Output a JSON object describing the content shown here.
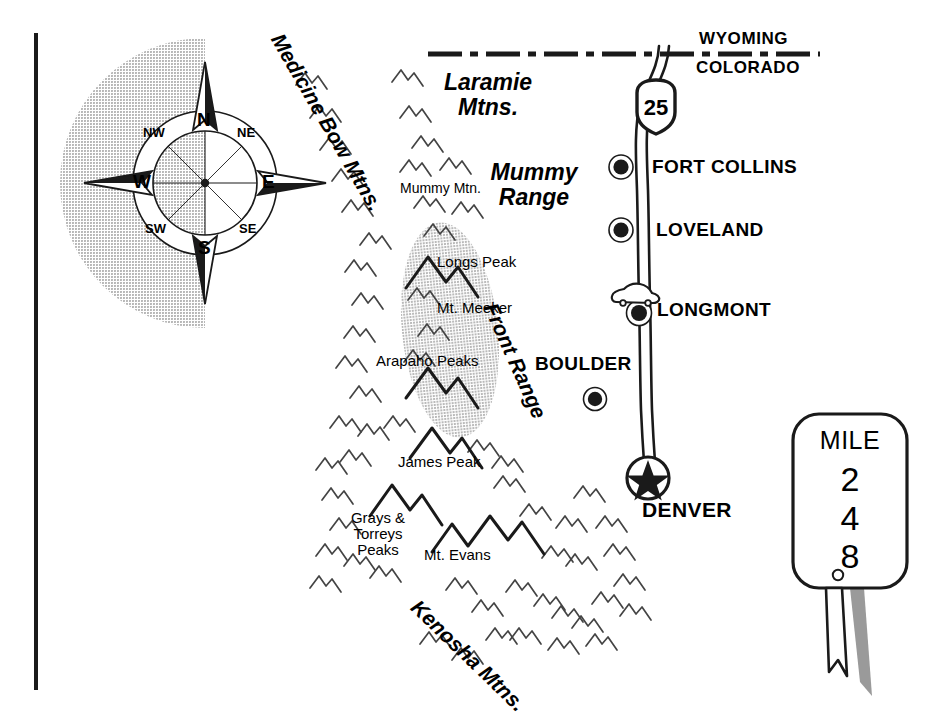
{
  "map": {
    "title": "Colorado Front Range Mountains and Interstate 25 locator map",
    "colors": {
      "ink": "#1a1a1a",
      "tint_gray": "#c6c6c6",
      "shadow_gray": "#9a9a9a",
      "paper": "#ffffff"
    }
  },
  "border": {
    "name": "left-rule"
  },
  "compass": {
    "north": "N",
    "south": "S",
    "east": "E",
    "west": "W",
    "northwest": "NW",
    "northeast": "NE",
    "southwest": "SW",
    "southeast": "SE"
  },
  "states": {
    "upper": "WYOMING",
    "lower": "COLORADO"
  },
  "highway": {
    "shield_number": "25",
    "shield_type": "interstate"
  },
  "cities": [
    {
      "name": "FORT COLLINS",
      "marker": "dot-circle"
    },
    {
      "name": "LOVELAND",
      "marker": "dot-circle"
    },
    {
      "name": "LONGMONT",
      "marker": "dot-circle-with-vehicle"
    },
    {
      "name": "BOULDER",
      "marker": "dot-circle"
    },
    {
      "name": "DENVER",
      "marker": "star-circle-capital"
    }
  ],
  "ranges": [
    {
      "label": "Medicine Bow Mtns.",
      "style": "rotated-italic"
    },
    {
      "label": "Laramie\nMtns.",
      "style": "italic"
    },
    {
      "label": "Mummy\nRange",
      "style": "italic"
    },
    {
      "label": "Front Range",
      "style": "rotated-italic"
    },
    {
      "label": "Kenosha Mtns.",
      "style": "rotated-italic"
    }
  ],
  "peaks": [
    {
      "label": "Mummy Mtn."
    },
    {
      "label": "Longs Peak"
    },
    {
      "label": "Mt. Meeker"
    },
    {
      "label": "Arapaho Peaks"
    },
    {
      "label": "James Peak"
    },
    {
      "label": "Grays &\nTorreys\nPeaks"
    },
    {
      "label": "Mt. Evans"
    }
  ],
  "mile_marker": {
    "word": "MILE",
    "digit1": "2",
    "digit2": "4",
    "digit3": "8",
    "full_number": "248"
  }
}
